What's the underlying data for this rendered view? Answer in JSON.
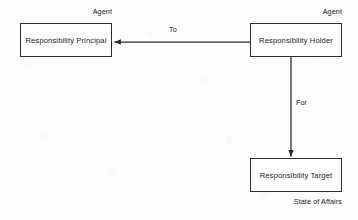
{
  "diagram": {
    "stroke_color": "#2b2b2b",
    "background_color": "#fdfdfd",
    "nodes": [
      {
        "id": "responsibility-principal",
        "label": "Responsibility Principal",
        "stereotype": "Agent",
        "stereotype_position": "above-right"
      },
      {
        "id": "responsibility-holder",
        "label": "Responsibility Holder",
        "stereotype": "Agent",
        "stereotype_position": "above-right"
      },
      {
        "id": "responsibility-target",
        "label": "Responsibility Target",
        "stereotype": "State of Affairs",
        "stereotype_position": "below-right"
      }
    ],
    "edges": [
      {
        "id": "holder-to-principal",
        "label": "To",
        "from": "responsibility-holder",
        "to": "responsibility-principal",
        "direction": "horizontal-left"
      },
      {
        "id": "holder-for-target",
        "label": "For",
        "from": "responsibility-holder",
        "to": "responsibility-target",
        "direction": "vertical-down"
      }
    ]
  }
}
